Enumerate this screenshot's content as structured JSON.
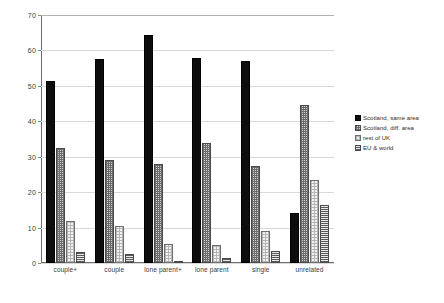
{
  "chart_data": {
    "type": "bar",
    "title": "",
    "xlabel": "",
    "ylabel": "",
    "ylim": [
      0,
      70
    ],
    "ytick_labels": [
      "0",
      "10",
      "20",
      "30",
      "40",
      "50",
      "60",
      "70"
    ],
    "ytick_values": [
      0,
      10,
      20,
      30,
      40,
      50,
      60,
      70
    ],
    "grid": true,
    "legend_position": "right",
    "categories": [
      "couple+",
      "couple",
      "lone parent+",
      "lone parent",
      "single",
      "unrelated"
    ],
    "series": [
      {
        "name": "Scotland, same area",
        "pattern": "solid-black",
        "color": "#0d0d0d",
        "values": [
          51.5,
          57.5,
          64.5,
          58,
          57,
          14
        ]
      },
      {
        "name": "Scotland, diff. area",
        "pattern": "dotted-medium-gray",
        "color": "#cfcfcf",
        "values": [
          32.5,
          29,
          28,
          34,
          27.5,
          44.5
        ]
      },
      {
        "name": "rest of UK",
        "pattern": "dotted-light-gray",
        "color": "#f2f2f2",
        "values": [
          12,
          10.5,
          5.5,
          5,
          9,
          23.5
        ]
      },
      {
        "name": "EU & world",
        "pattern": "horizontal-hatch",
        "color": "#e8e8e8",
        "values": [
          3,
          2.5,
          0.5,
          1.5,
          3.5,
          16.5
        ]
      }
    ]
  },
  "legend": {
    "items": [
      {
        "label": "Scotland, same area"
      },
      {
        "label": "Scotland, diff. area"
      },
      {
        "label": "rest of UK"
      },
      {
        "label": "EU & world"
      }
    ]
  }
}
